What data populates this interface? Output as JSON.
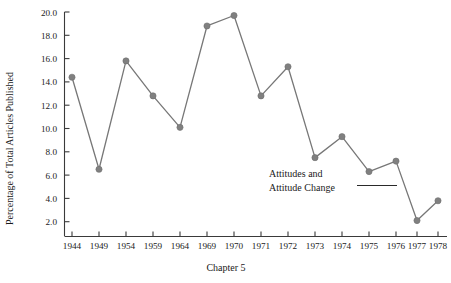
{
  "chart_data": {
    "type": "line",
    "title": "",
    "xlabel": "Chapter 5",
    "ylabel": "Percentage of Total Articles Published",
    "categories": [
      "1944",
      "1949",
      "1954",
      "1959",
      "1964",
      "1969",
      "1970",
      "1971",
      "1972",
      "1973",
      "1974",
      "1975",
      "1976",
      "1977",
      "1978"
    ],
    "values": [
      14.4,
      6.5,
      15.8,
      12.8,
      10.1,
      18.8,
      19.7,
      12.8,
      15.3,
      7.5,
      9.3,
      6.3,
      7.2,
      2.1,
      3.8
    ],
    "series": [
      {
        "name": "Attitudes and Attitude Change",
        "values": [
          14.4,
          6.5,
          15.8,
          12.8,
          10.1,
          18.8,
          19.7,
          12.8,
          15.3,
          7.5,
          9.3,
          6.3,
          7.2,
          2.1,
          3.8
        ]
      }
    ],
    "ylim": [
      0.0,
      20.0
    ],
    "yticks": [
      "2.0",
      "4.0",
      "6.0",
      "8.0",
      "10.0",
      "12.0",
      "14.0",
      "16.0",
      "18.0",
      "20.0"
    ],
    "ytick_values": [
      2.0,
      4.0,
      6.0,
      8.0,
      10.0,
      12.0,
      14.0,
      16.0,
      18.0,
      20.0
    ],
    "grid": false,
    "legend": "none",
    "marker": "circle",
    "line_color": "#777777",
    "marker_color": "#808080",
    "axis_color": "#3a3a3a",
    "annotations": [
      {
        "name": "series-callout",
        "line1": "Attitudes and",
        "line2": "Attitude Change"
      }
    ]
  },
  "axes": {
    "y_title": "Percentage of Total Articles Published",
    "x_title": "Chapter 5"
  }
}
